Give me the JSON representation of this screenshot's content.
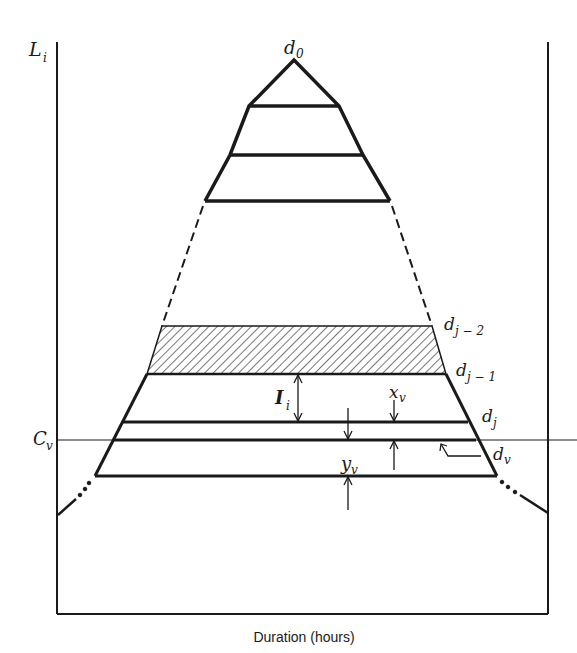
{
  "figure": {
    "xlabel": "Duration (hours)",
    "ylabel_main": "L",
    "ylabel_sub": "i",
    "reference_line_label_main": "C",
    "reference_line_label_sub": "v",
    "apex_label_main": "d",
    "apex_label_sub": "0",
    "labels": {
      "dj2_main": "d",
      "dj2_sub": "j − 2",
      "dj1_main": "d",
      "dj1_sub": "j − 1",
      "dj_main": "d",
      "dj_sub": "j",
      "dv_main": "d",
      "dv_sub": "v",
      "Ii_main": "I",
      "Ii_sub": "i",
      "xv_main": "x",
      "xv_sub": "v",
      "yv_main": "y",
      "yv_sub": "v"
    },
    "colors": {
      "ink": "#1a1a1a",
      "background": "#ffffff"
    }
  }
}
